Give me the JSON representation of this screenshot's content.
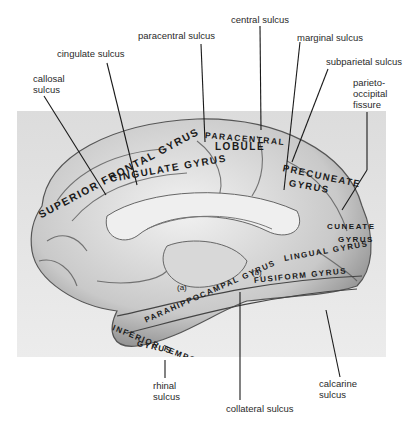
{
  "figure": {
    "sulci_labels": [
      {
        "id": "paracentral-sulcus",
        "text": "paracentral sulcus"
      },
      {
        "id": "central-sulcus",
        "text": "central sulcus"
      },
      {
        "id": "marginal-sulcus",
        "text": "marginal sulcus"
      },
      {
        "id": "cingulate-sulcus",
        "text": "cingulate sulcus"
      },
      {
        "id": "subparietal-sulcus",
        "text": "subparietal sulcus"
      },
      {
        "id": "callosal-sulcus",
        "text": "callosal\nsulcus"
      },
      {
        "id": "parieto-occipital-fissure",
        "text": "parieto-\noccipital\nfissure"
      },
      {
        "id": "rhinal-sulcus",
        "text": "rhinal\nsulcus"
      },
      {
        "id": "calcarine-sulcus",
        "text": "calcarine\nsulcus"
      },
      {
        "id": "collateral-sulcus",
        "text": "collateral sulcus"
      }
    ],
    "gyri_labels": [
      {
        "id": "superior-frontal-gyrus",
        "text": "SUPERIOR FRONTAL GYRUS"
      },
      {
        "id": "cingulate-gyrus",
        "text": "CINGULATE GYRUS"
      },
      {
        "id": "paracentral-lobule-1",
        "text": "PARACENTRAL"
      },
      {
        "id": "paracentral-lobule-2",
        "text": "LOBULE"
      },
      {
        "id": "precuneate-gyrus-1",
        "text": "PRECUNEATE"
      },
      {
        "id": "precuneate-gyrus-2",
        "text": "GYRUS"
      },
      {
        "id": "cuneate-gyrus-1",
        "text": "CUNEATE"
      },
      {
        "id": "cuneate-gyrus-2",
        "text": "GYRUS"
      },
      {
        "id": "lingual-gyrus",
        "text": "LINGUAL GYRUS"
      },
      {
        "id": "fusiform-gyrus",
        "text": "FUSIFORM GYRUS"
      },
      {
        "id": "parahippocampal-gyrus",
        "text": "PARAHIPPOCAMPAL GYRUS"
      },
      {
        "id": "inferior-temporal-gyrus-1",
        "text": "INFERIOR TEMPORAL"
      },
      {
        "id": "inferior-temporal-gyrus-2",
        "text": "GYRUS"
      }
    ],
    "markers": [
      {
        "id": "marker-a",
        "text": "(a)"
      },
      {
        "id": "marker-b",
        "text": "(b)"
      }
    ]
  }
}
